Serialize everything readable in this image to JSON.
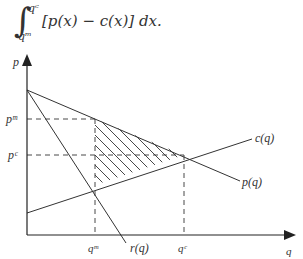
{
  "formula": {
    "integral_symbol": "∫",
    "upper_limit": "q^c",
    "upper_limit_display": "qᶜ",
    "lower_limit": "q^m",
    "lower_limit_display": "qᵐ",
    "integrand": "[p(x) − c(x)] dx."
  },
  "diagram": {
    "axes": {
      "y_label": "p",
      "x_label": "q"
    },
    "curves": [
      {
        "name": "p(q)",
        "label": "p(q)",
        "description": "inverse demand, downward sloping"
      },
      {
        "name": "r(q)",
        "label": "r(q)",
        "description": "marginal revenue, steeper downward slope"
      },
      {
        "name": "c(q)",
        "label": "c(q)",
        "description": "marginal cost, upward sloping"
      }
    ],
    "markers": {
      "y_ticks": [
        {
          "label": "p^m",
          "display": "pᵐ"
        },
        {
          "label": "p^c",
          "display": "pᶜ"
        }
      ],
      "x_ticks": [
        {
          "label": "q^m",
          "display": "qᵐ"
        },
        {
          "label": "q^c",
          "display": "qᶜ"
        }
      ]
    },
    "shaded_region": "hatched area between p(q) and c(q) from q^m to q^c (deadweight loss)",
    "colors": {
      "line": "#333333",
      "background": "#ffffff"
    }
  }
}
